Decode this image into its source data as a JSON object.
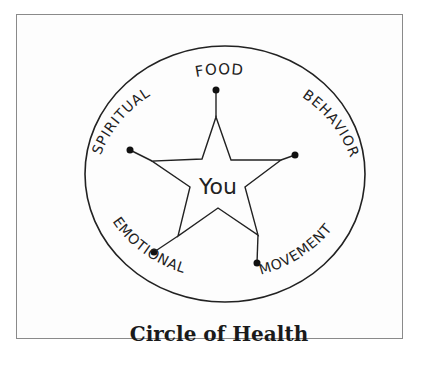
{
  "caption": "Circle of Health",
  "center_label": "You",
  "spokes": [
    {
      "label": "FOOD",
      "position": "top"
    },
    {
      "label": "BEHAVIOR",
      "position": "right"
    },
    {
      "label": "MOVEMENT",
      "position": "bottom-right"
    },
    {
      "label": "EMOTIONAL",
      "position": "bottom-left"
    },
    {
      "label": "SPIRITUAL",
      "position": "left"
    }
  ],
  "colors": {
    "ink": "#222222",
    "frame": "#8a8a8a",
    "background": "#ffffff"
  }
}
